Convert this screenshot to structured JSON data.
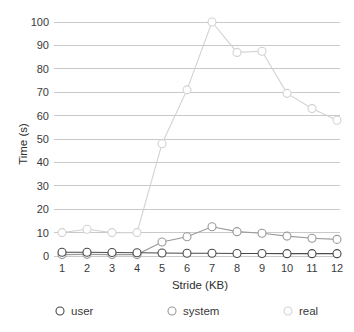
{
  "chart_data": {
    "type": "line",
    "title": "",
    "xlabel": "Stride (KB)",
    "ylabel": "Time (s)",
    "x": [
      1,
      2,
      3,
      4,
      5,
      6,
      7,
      8,
      9,
      10,
      11,
      12
    ],
    "categories": [
      "1",
      "2",
      "3",
      "4",
      "5",
      "6",
      "7",
      "8",
      "9",
      "10",
      "11",
      "12"
    ],
    "xlim": [
      1,
      12
    ],
    "ylim": [
      0,
      100
    ],
    "yticks": [
      0,
      10,
      20,
      30,
      40,
      50,
      60,
      70,
      80,
      90,
      100
    ],
    "ytick_labels": [
      "0",
      "10",
      "20",
      "30",
      "40",
      "50",
      "60",
      "70",
      "80",
      "90",
      "100"
    ],
    "grid": "horizontal",
    "legend_position": "bottom",
    "marker": "open-circle",
    "series": [
      {
        "name": "user",
        "color": "#4a4a4a",
        "values": [
          1.6,
          1.6,
          1.5,
          1.4,
          1.3,
          1.2,
          1.2,
          1.1,
          1.1,
          1.0,
          1.0,
          1.0
        ]
      },
      {
        "name": "system",
        "color": "#9a9a9a",
        "values": [
          0.6,
          0.7,
          0.6,
          0.6,
          6.0,
          8.2,
          12.5,
          10.4,
          9.7,
          8.5,
          7.6,
          7.1
        ]
      },
      {
        "name": "real",
        "color": "#d2d2d2",
        "values": [
          10.0,
          11.4,
          10.0,
          10.0,
          48.0,
          71.0,
          100.0,
          87.0,
          87.5,
          69.5,
          63.0,
          58.0
        ]
      }
    ]
  },
  "legend": {
    "items": [
      {
        "label": "user",
        "marker": "open-circle-marker",
        "color": "#4a4a4a"
      },
      {
        "label": "system",
        "marker": "open-circle-marker",
        "color": "#9a9a9a"
      },
      {
        "label": "real",
        "marker": "open-circle-marker",
        "color": "#d2d2d2"
      }
    ]
  }
}
